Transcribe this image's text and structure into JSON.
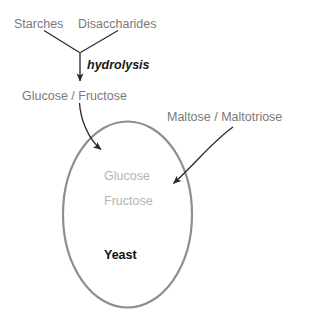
{
  "diagram": {
    "colors": {
      "label_gray": "#7a7a7a",
      "label_faint_gray": "#b4b4b4",
      "label_dark": "#111111",
      "arrow_dark": "#2b2b2b",
      "cell_outline_gray": "#8e8e8e",
      "background": "#ffffff"
    },
    "labels": {
      "starches": "Starches",
      "disaccharides": "Disaccharides",
      "hydrolysis": "hydrolysis",
      "glucose_fructose_outer": "Glucose / Fructose",
      "maltose_maltotriose": "Maltose / Maltotriose",
      "glucose_inner": "Glucose",
      "fructose_inner": "Fructose",
      "yeast": "Yeast"
    },
    "shapes": {
      "yeast_cell": {
        "name": "yeast-cell-ellipse",
        "cx": 127.5,
        "cy": 214.5,
        "rx": 64.5,
        "ry": 93,
        "stroke": "#8e8e8e",
        "stroke_width": 2.2,
        "fill": "none"
      }
    },
    "arrows": [
      {
        "name": "starches-to-junction-arrow",
        "from": "Starches",
        "to": "hydrolysis junction",
        "style": "straight",
        "head": false
      },
      {
        "name": "disaccharides-to-junction-arrow",
        "from": "Disaccharides",
        "to": "hydrolysis junction",
        "style": "straight",
        "head": false
      },
      {
        "name": "hydrolysis-arrow",
        "from": "hydrolysis junction",
        "to": "Glucose / Fructose",
        "style": "straight",
        "head": true
      },
      {
        "name": "glucose-fructose-uptake-arrow",
        "from": "Glucose / Fructose",
        "to": "Yeast cell",
        "style": "curved",
        "head": true
      },
      {
        "name": "maltose-maltotriose-uptake-arrow",
        "from": "Maltose / Maltotriose",
        "to": "Yeast cell",
        "style": "curved",
        "head": true
      }
    ]
  }
}
